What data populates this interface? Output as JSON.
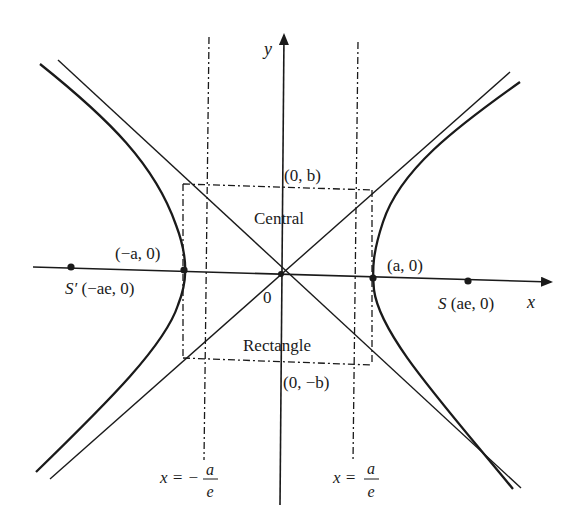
{
  "figure": {
    "axes": {
      "x_label": "x",
      "y_label": "y",
      "origin_label": "0"
    },
    "points": {
      "vertex_left": "(−a, 0)",
      "vertex_right": "(a, 0)",
      "focus_left_name": "S′",
      "focus_left_coords": "(−ae, 0)",
      "focus_right_name": "S",
      "focus_right_coords": "(ae, 0)",
      "top": "(0, b)",
      "bottom": "(0, −b)"
    },
    "rectangle": {
      "label_top": "Central",
      "label_bottom": "Rectangle"
    },
    "directrices": {
      "left": {
        "lhs": "x = −",
        "num": "a",
        "den": "e"
      },
      "right": {
        "lhs": "x = ",
        "num": "a",
        "den": "e"
      }
    },
    "colors": {
      "ink": "#1a1a1a",
      "background": "#ffffff"
    }
  }
}
